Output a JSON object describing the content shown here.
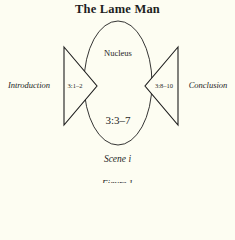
{
  "title": "The Lame Man",
  "diagram": {
    "center": {
      "label": "Nucleus",
      "range": "3:3–7"
    },
    "left": {
      "label": "Introduction",
      "range": "3:1–2"
    },
    "right": {
      "label": "Conclusion",
      "range": "3:8–10"
    }
  },
  "caption": "Scene i",
  "figure_label": "Figure 1",
  "colors": {
    "background": "#fdfdf2",
    "ink": "#1e1e1e"
  }
}
